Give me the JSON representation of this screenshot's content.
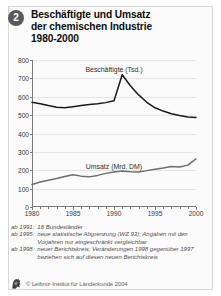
{
  "figure": {
    "number_badge": "2",
    "title_lines": [
      "Beschäftigte und Umsatz",
      "der chemischen Industrie",
      "1980-2000"
    ]
  },
  "chart_data": {
    "type": "line",
    "title": "Beschäftigte und Umsatz der chemischen Industrie 1980-2000",
    "xlabel": "",
    "ylabel": "",
    "xlim": [
      1980,
      2000
    ],
    "ylim": [
      0,
      800
    ],
    "yticks": [
      0,
      100,
      200,
      300,
      400,
      500,
      600,
      700,
      800
    ],
    "xticks": [
      1980,
      1985,
      1990,
      1995,
      2000
    ],
    "xtick_labels": [
      "1980",
      "1985",
      "1990",
      "1995",
      "2000"
    ],
    "grid": true,
    "legend": "inline-labels",
    "x": [
      1980,
      1981,
      1982,
      1983,
      1984,
      1985,
      1986,
      1987,
      1988,
      1989,
      1990,
      1991,
      1992,
      1993,
      1994,
      1995,
      1996,
      1997,
      1998,
      1999,
      2000
    ],
    "series": [
      {
        "name": "Beschäftigte (Tsd.)",
        "unit": "Tsd.",
        "color": "#1a1a1a",
        "label_x": 1990,
        "label_y": 745,
        "values": [
          570,
          562,
          552,
          543,
          540,
          546,
          553,
          558,
          562,
          568,
          578,
          720,
          660,
          610,
          570,
          540,
          522,
          508,
          498,
          490,
          487
        ]
      },
      {
        "name": "Umsatz (Mrd. DM)",
        "unit": "Mrd. DM",
        "color": "#6e6e6e",
        "label_x": 1990,
        "label_y": 218,
        "values": [
          122,
          136,
          146,
          155,
          166,
          176,
          168,
          164,
          172,
          183,
          190,
          196,
          192,
          190,
          198,
          206,
          212,
          220,
          218,
          228,
          262
        ]
      }
    ]
  },
  "footnotes": [
    {
      "key": "ab 1991:",
      "text": "16 Bundesländer"
    },
    {
      "key": "ab 1995:",
      "text": "neue statistische Abgrenzung (WZ 93); Angaben mit den Vorjahren nur eingeschränkt vergleichbar"
    },
    {
      "key": "ab 1998:",
      "text": "neuer Berichtskreis; Veränderungen 1998 gegenüber 1997 beziehen sich auf diesen neuen Berichtskreis"
    }
  ],
  "credit": {
    "text": "© Leibniz-Institut für Länderkunde 2004",
    "logo_icon": "ifl-lion-logo-icon"
  }
}
